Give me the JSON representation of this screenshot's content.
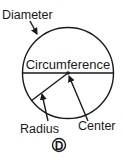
{
  "diagram": {
    "labels": {
      "diameter": "Diameter",
      "circumference": "Circumference",
      "radius": "Radius",
      "center": "Center"
    },
    "option_marker": "D",
    "colors": {
      "ink": "#1a1a1a",
      "background": "#ffffff"
    }
  }
}
